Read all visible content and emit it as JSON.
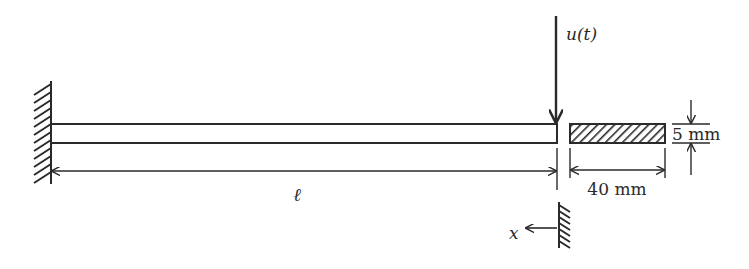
{
  "diagram": {
    "type": "cantilever-beam-schematic",
    "colors": {
      "stroke": "#2a2a2a",
      "background": "#ffffff"
    },
    "labels": {
      "force": "u(t)",
      "length": "ℓ",
      "width": "40 mm",
      "thickness": "5 mm",
      "axis": "x"
    },
    "elements": {
      "fixed_support": "left wall (clamped end)",
      "beam": "cantilever beam",
      "cross_section": "hatched rectangular cross-section",
      "sensor_wall": "small wall reference with x-axis arrow"
    }
  }
}
